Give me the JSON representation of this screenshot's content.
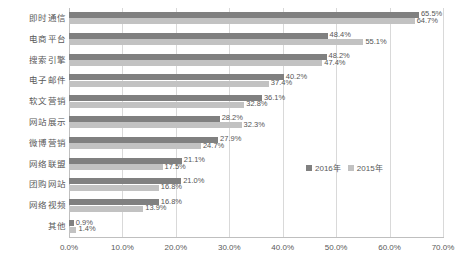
{
  "chart_data": {
    "type": "bar",
    "orientation": "horizontal",
    "title": "",
    "xlabel": "",
    "ylabel": "",
    "xlim": [
      0,
      70
    ],
    "xticks": [
      "0.0%",
      "10.0%",
      "20.0%",
      "30.0%",
      "40.0%",
      "50.0%",
      "60.0%",
      "70.0%"
    ],
    "xtick_values": [
      0,
      10,
      20,
      30,
      40,
      50,
      60,
      70
    ],
    "grid": true,
    "legend_position": "inside-right",
    "categories": [
      "即时通信",
      "电商平台",
      "搜索引擎",
      "电子邮件",
      "软文营销",
      "网站展示",
      "微博营销",
      "网络联盟",
      "团购网站",
      "网络视频",
      "其他"
    ],
    "series": [
      {
        "name": "2016年",
        "color": "#808080",
        "values": [
          65.5,
          48.4,
          48.2,
          40.2,
          36.1,
          28.2,
          27.9,
          21.1,
          21.0,
          16.8,
          0.9
        ],
        "labels": [
          "65.5%",
          "48.4%",
          "48.2%",
          "40.2%",
          "36.1%",
          "28.2%",
          "27.9%",
          "21.1%",
          "21.0%",
          "16.8%",
          "0.9%"
        ]
      },
      {
        "name": "2015年",
        "color": "#c2c2c2",
        "values": [
          64.7,
          55.1,
          47.4,
          37.4,
          32.8,
          32.3,
          24.7,
          17.5,
          16.8,
          13.9,
          1.4
        ],
        "labels": [
          "64.7%",
          "55.1%",
          "47.4%",
          "37.4%",
          "32.8%",
          "32.3%",
          "24.7%",
          "17.5%",
          "16.8%",
          "13.9%",
          "1.4%"
        ]
      }
    ]
  },
  "legend": {
    "items": [
      {
        "label": "2016年",
        "color": "#808080"
      },
      {
        "label": "2015年",
        "color": "#c2c2c2"
      }
    ]
  }
}
